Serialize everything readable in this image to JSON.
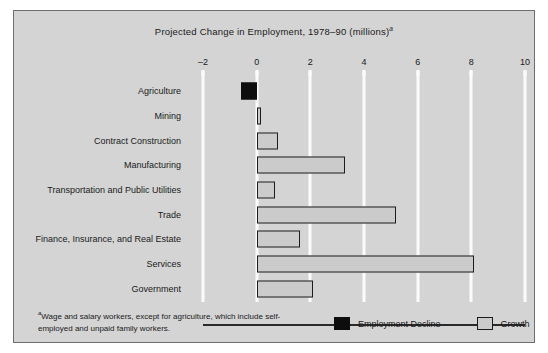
{
  "figure": {
    "background_color": "#d4d4d4",
    "border_color": "#6e6e6e",
    "title": "Projected Change in Employment, 1978–90 (millions)",
    "title_superscript": "a",
    "footnote_superscript": "a",
    "footnote": "Wage and salary workers, except for agriculture, which include self-employed and unpaid family workers."
  },
  "legend": {
    "position": "bottom-right",
    "entries": [
      {
        "label": "Employment Decline",
        "color": "#0d0d0d",
        "swatch": "decline"
      },
      {
        "label": "Growth",
        "color": "#cbcbcb",
        "swatch": "growth"
      }
    ]
  },
  "chart_data": {
    "type": "bar",
    "orientation": "horizontal",
    "title": "Projected Change in Employment, 1978–90 (millions)",
    "xlabel": "",
    "ylabel": "",
    "xlim": [
      -2,
      10
    ],
    "xticks": [
      -2,
      0,
      2,
      4,
      6,
      8,
      10
    ],
    "xticklabels": [
      "–2",
      "0",
      "2",
      "4",
      "6",
      "8",
      "10"
    ],
    "grid": true,
    "grid_color": "#fbfbfb",
    "legend_position": "bottom-right",
    "categories": [
      "Agriculture",
      "Mining",
      "Contract Construction",
      "Manufacturing",
      "Transportation and Public Utilities",
      "Trade",
      "Finance, Insurance, and Real Estate",
      "Services",
      "Government"
    ],
    "values": [
      -0.6,
      0.1,
      0.8,
      3.3,
      0.7,
      5.2,
      1.6,
      8.1,
      2.1
    ],
    "series": [
      {
        "name": "Projected change in employment",
        "values": [
          -0.6,
          0.1,
          0.8,
          3.3,
          0.7,
          5.2,
          1.6,
          8.1,
          2.1
        ],
        "colors": [
          "#0d0d0d",
          "#cbcbcb",
          "#cbcbcb",
          "#cbcbcb",
          "#cbcbcb",
          "#cbcbcb",
          "#cbcbcb",
          "#cbcbcb",
          "#cbcbcb"
        ]
      }
    ]
  }
}
